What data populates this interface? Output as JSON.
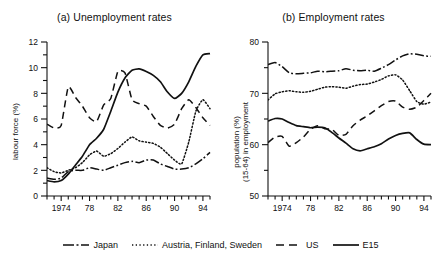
{
  "figure": {
    "panels": [
      {
        "id": "a",
        "title": "(a) Unemployment rates",
        "ylabel": "labour force (%)"
      },
      {
        "id": "b",
        "title": "(b) Employment rates",
        "ylabel_line1": "population (%)",
        "ylabel_line2": "(15-64) in employment"
      }
    ],
    "legend": {
      "items": [
        {
          "label": "Japan",
          "dash": "dashdot"
        },
        {
          "label": "Austria, Finland, Sweden",
          "dash": "dotted"
        },
        {
          "label": "US",
          "dash": "dashed"
        },
        {
          "label": "E15",
          "dash": "solid"
        }
      ]
    }
  },
  "chart_data": [
    {
      "type": "line",
      "title": "(a) Unemployment rates",
      "xlabel": "",
      "ylabel": "labour force (%)",
      "xlim": [
        1972,
        1995
      ],
      "ylim": [
        0,
        12
      ],
      "yticks": [
        0,
        2,
        4,
        6,
        8,
        10,
        12
      ],
      "xticks": [
        1974,
        1978,
        1982,
        1986,
        1990,
        1994
      ],
      "xtick_labels": [
        "1974",
        "78",
        "82",
        "86",
        "90",
        "94"
      ],
      "minor_xticks_every": 1,
      "grid": false,
      "legend_position": "bottom",
      "x": [
        1972,
        1973,
        1974,
        1975,
        1976,
        1977,
        1978,
        1979,
        1980,
        1981,
        1982,
        1983,
        1984,
        1985,
        1986,
        1987,
        1988,
        1989,
        1990,
        1991,
        1992,
        1993,
        1994,
        1995
      ],
      "series": [
        {
          "name": "Japan",
          "dash": "dashdot",
          "values": [
            1.4,
            1.3,
            1.4,
            1.9,
            2.0,
            2.0,
            2.2,
            2.1,
            2.0,
            2.2,
            2.4,
            2.6,
            2.7,
            2.6,
            2.8,
            2.8,
            2.5,
            2.3,
            2.1,
            2.1,
            2.2,
            2.5,
            2.9,
            3.4
          ]
        },
        {
          "name": "Austria, Finland, Sweden",
          "dash": "dotted",
          "values": [
            2.2,
            1.9,
            1.8,
            2.0,
            2.2,
            2.6,
            3.2,
            3.5,
            3.1,
            3.3,
            3.7,
            4.2,
            4.6,
            4.3,
            4.2,
            4.1,
            3.8,
            3.3,
            2.8,
            2.5,
            4.2,
            6.6,
            7.5,
            6.8
          ]
        },
        {
          "name": "US",
          "dash": "dashed",
          "values": [
            5.6,
            5.3,
            5.5,
            8.5,
            7.7,
            7.0,
            6.1,
            5.8,
            7.1,
            7.6,
            9.7,
            9.6,
            7.5,
            7.2,
            7.0,
            6.2,
            5.5,
            5.3,
            5.6,
            6.8,
            7.5,
            6.9,
            6.1,
            5.5
          ]
        },
        {
          "name": "E15",
          "dash": "solid",
          "values": [
            1.2,
            1.1,
            1.2,
            1.7,
            2.4,
            3.1,
            4.0,
            4.5,
            5.2,
            6.6,
            8.1,
            9.2,
            9.8,
            9.9,
            9.7,
            9.4,
            8.9,
            8.1,
            7.6,
            8.0,
            8.9,
            10.1,
            11.0,
            11.1
          ]
        }
      ]
    },
    {
      "type": "line",
      "title": "(b) Employment rates",
      "xlabel": "",
      "ylabel": "population (%) (15-64) in employment",
      "xlim": [
        1972,
        1995
      ],
      "ylim": [
        50,
        80
      ],
      "yticks": [
        50,
        55,
        60,
        65,
        70,
        75,
        80
      ],
      "ytick_labels": [
        "50",
        "",
        "60",
        "",
        "70",
        "",
        "80"
      ],
      "xticks": [
        1974,
        1978,
        1982,
        1986,
        1990,
        1994
      ],
      "xtick_labels": [
        "1974",
        "78",
        "82",
        "86",
        "90",
        "94"
      ],
      "minor_xticks_every": 1,
      "grid": false,
      "legend_position": "bottom",
      "x": [
        1972,
        1973,
        1974,
        1975,
        1976,
        1977,
        1978,
        1979,
        1980,
        1981,
        1982,
        1983,
        1984,
        1985,
        1986,
        1987,
        1988,
        1989,
        1990,
        1991,
        1992,
        1993,
        1994,
        1995
      ],
      "series": [
        {
          "name": "Japan",
          "dash": "dashdot",
          "values": [
            75.6,
            76.0,
            75.2,
            74.0,
            73.8,
            73.9,
            74.0,
            74.3,
            74.2,
            74.3,
            74.4,
            74.8,
            74.5,
            74.4,
            74.5,
            74.3,
            74.9,
            75.6,
            76.5,
            77.3,
            77.7,
            77.6,
            77.3,
            77.2
          ]
        },
        {
          "name": "Austria, Finland, Sweden",
          "dash": "dotted",
          "values": [
            68.7,
            69.9,
            70.3,
            70.5,
            70.3,
            70.2,
            70.4,
            70.8,
            71.2,
            71.3,
            71.2,
            71.0,
            71.4,
            71.7,
            71.8,
            72.2,
            72.7,
            73.4,
            73.6,
            72.6,
            70.5,
            68.4,
            67.9,
            68.3
          ]
        },
        {
          "name": "US",
          "dash": "dashed",
          "values": [
            60.4,
            61.5,
            61.6,
            59.7,
            60.4,
            61.5,
            63.0,
            63.7,
            63.1,
            63.0,
            61.8,
            62.0,
            63.7,
            64.8,
            65.6,
            66.6,
            67.6,
            68.4,
            68.5,
            67.3,
            66.9,
            67.3,
            68.6,
            70.0
          ]
        },
        {
          "name": "E15",
          "dash": "solid",
          "values": [
            64.6,
            65.1,
            65.0,
            64.3,
            63.7,
            63.5,
            63.3,
            63.4,
            63.3,
            62.4,
            61.3,
            60.3,
            59.2,
            58.8,
            59.2,
            59.6,
            60.2,
            61.1,
            61.8,
            62.2,
            62.3,
            61.0,
            60.1,
            60.0
          ]
        }
      ]
    }
  ]
}
